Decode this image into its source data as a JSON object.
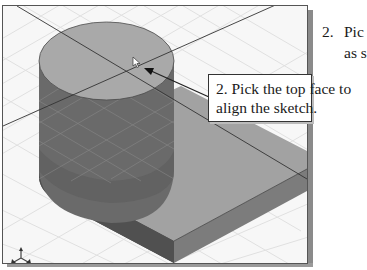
{
  "viewport": {
    "label": "3D modeling viewport",
    "colors": {
      "background": "#f6f6f6",
      "grid": "#e0e0e0",
      "top_face": "#a8a8a8",
      "cylinder_side": "#6e6e6e",
      "box_top": "#9c9c9c",
      "box_front_dark": "#555555",
      "box_side": "#7a7a7a",
      "sketch_line": "#333333"
    }
  },
  "callout": {
    "line1": "2. Pick the top face to",
    "line2": "align the sketch."
  },
  "instructions": {
    "step_number": "2.",
    "line1": "Pic",
    "line2": "as s"
  },
  "cursor": {
    "icon": "pointer-arrow-icon"
  },
  "triad": {
    "icon": "view-triad-icon"
  }
}
